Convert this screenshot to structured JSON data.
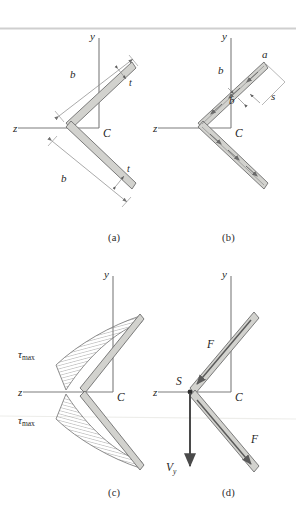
{
  "figure": {
    "background_color": "#ffffff",
    "rule_color": "#cfcfcf",
    "leg_fill_color": "#d2d2ce",
    "leg_edge_color": "#6e6e6e",
    "axis_color": "#7a7a7a",
    "dim_color": "#8a8a8a",
    "hatch_color": "#777777",
    "arrow_color": "#555555",
    "force_color": "#4a4a4a"
  },
  "captions": {
    "a": "(a)",
    "b": "(b)",
    "c": "(c)",
    "d": "(d)"
  },
  "panels": {
    "a": {
      "name": "cross-section-geometry",
      "axis_y": "y",
      "axis_z": "z",
      "centroid": "C",
      "dim_leg_upper": "b",
      "dim_leg_lower": "b",
      "thickness_upper": "t",
      "thickness_lower": "t"
    },
    "b": {
      "name": "shear-flow-coordinates",
      "axis_y": "y",
      "axis_z": "z",
      "centroid": "C",
      "end_point": "a",
      "dim_upper": "b",
      "dim_inner": "b",
      "coordinate_s": "s"
    },
    "c": {
      "name": "shear-stress-distribution",
      "axis_y": "y",
      "axis_z": "z",
      "centroid": "C",
      "stress_upper": "τmax",
      "stress_lower": "τmax",
      "stress_upper_sub": "max",
      "stress_lower_sub": "max",
      "tau_symbol": "τ"
    },
    "d": {
      "name": "resultant-forces-shear-center",
      "axis_y": "y",
      "axis_z": "z",
      "centroid": "C",
      "shear_center": "S",
      "force_upper": "F",
      "force_lower": "F",
      "shear_force": "V",
      "shear_force_sub": "y"
    }
  }
}
